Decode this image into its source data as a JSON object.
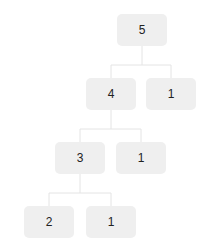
{
  "diagram": {
    "type": "tree",
    "colors": {
      "node_fill": "#efefef",
      "edge": "#e4e4e4",
      "text": "#222222",
      "background": "#ffffff"
    },
    "nodes": [
      {
        "id": "n5",
        "label": "5",
        "x": 117,
        "y": 14
      },
      {
        "id": "n4",
        "label": "4",
        "x": 86,
        "y": 78
      },
      {
        "id": "n1a",
        "label": "1",
        "x": 146,
        "y": 78
      },
      {
        "id": "n3",
        "label": "3",
        "x": 55,
        "y": 142
      },
      {
        "id": "n1b",
        "label": "1",
        "x": 116,
        "y": 142
      },
      {
        "id": "n2",
        "label": "2",
        "x": 24,
        "y": 206
      },
      {
        "id": "n1c",
        "label": "1",
        "x": 86,
        "y": 206
      }
    ],
    "edges": [
      [
        "n5",
        "n4"
      ],
      [
        "n5",
        "n1a"
      ],
      [
        "n4",
        "n3"
      ],
      [
        "n4",
        "n1b"
      ],
      [
        "n3",
        "n2"
      ],
      [
        "n3",
        "n1c"
      ]
    ]
  }
}
